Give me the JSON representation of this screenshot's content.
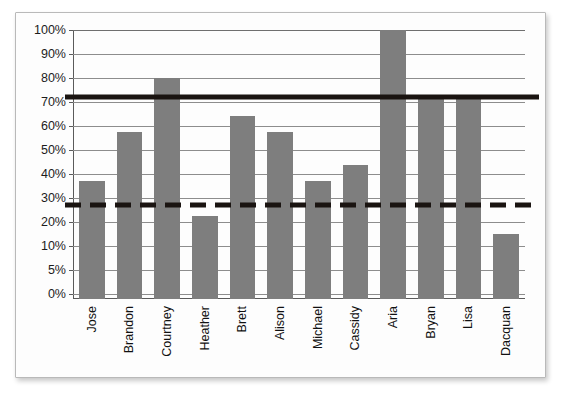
{
  "chart_data": {
    "type": "bar",
    "title": "",
    "subtitle": "",
    "xlabel": "",
    "ylabel": "",
    "categories": [
      "Jose",
      "Brandon",
      "Courtney",
      "Heather",
      "Brett",
      "Alison",
      "Michael",
      "Cassidy",
      "Aria",
      "Bryan",
      "Lisa",
      "Dacquan"
    ],
    "values": [
      44,
      62,
      82,
      31,
      68,
      62,
      44,
      50,
      100,
      75,
      75,
      24
    ],
    "value_unit": "%",
    "ylim": [
      0,
      100
    ],
    "ytick_labels": [
      "100%",
      "90%",
      "80%",
      "70%",
      "60%",
      "50%",
      "40%",
      "30%",
      "20%",
      "10%",
      "5%",
      "0%"
    ],
    "ytick_values": [
      100,
      90,
      80,
      70,
      60,
      50,
      40,
      30,
      20,
      10,
      5,
      0
    ],
    "grid": true,
    "legend": "none",
    "bar_color": "#7e7e7e",
    "reference_lines": [
      {
        "name": "upper-benchmark-line",
        "value": 75,
        "style": "solid",
        "color": "#1a1411"
      },
      {
        "name": "lower-benchmark-line",
        "value": 35,
        "style": "dashed",
        "color": "#1a1411"
      }
    ],
    "series": [
      {
        "name": "percent",
        "values": [
          44,
          62,
          82,
          31,
          68,
          62,
          44,
          50,
          100,
          75,
          75,
          24
        ]
      }
    ],
    "axis_note": "vertical axis ticks are evenly spaced but labeled 100% down to 10% in steps of 10, then 5% and 0%"
  }
}
